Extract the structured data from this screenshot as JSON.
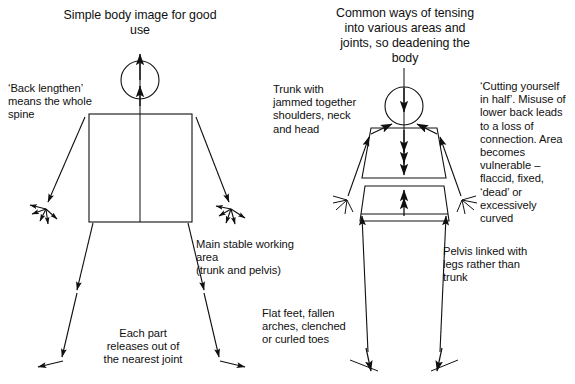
{
  "diagram": {
    "kind": "anatomical-line-diagram",
    "background_color": "#ffffff",
    "ink_color": "#101010",
    "panels": [
      {
        "id": "good-use",
        "title": "Simple body image for good\nuse",
        "labels": [
          {
            "id": "back-lengthen",
            "text": "‘Back lengthen’\nmeans the whole\nspine"
          },
          {
            "id": "main-stable-working-area",
            "text": "Main stable working area\n(trunk and pelvis)"
          },
          {
            "id": "each-part-releases",
            "text": "Each part\nreleases out of\nthe nearest joint"
          }
        ]
      },
      {
        "id": "common-tensing",
        "title": "Common ways of tensing\ninto various areas and\njoints, so deadening the\nbody",
        "labels": [
          {
            "id": "trunk-with-jammed",
            "text": "Trunk with\njammed together\nshoulders, neck\nand head"
          },
          {
            "id": "cutting-yourself-in-half",
            "text": "‘Cutting yourself\nin half’. Misuse of\nlower back leads\nto a loss of\nconnection. Area\nbecomes\nvulnerable –\nflaccid, fixed,\n‘dead’ or\nexcessively\ncurved"
          },
          {
            "id": "pelvis-linked-with-legs",
            "text": "Pelvis linked with\nlegs rather than\ntrunk"
          },
          {
            "id": "flat-feet-fallen-arches",
            "text": "Flat feet, fallen\narches, clenched\nor curled toes"
          }
        ]
      }
    ]
  }
}
